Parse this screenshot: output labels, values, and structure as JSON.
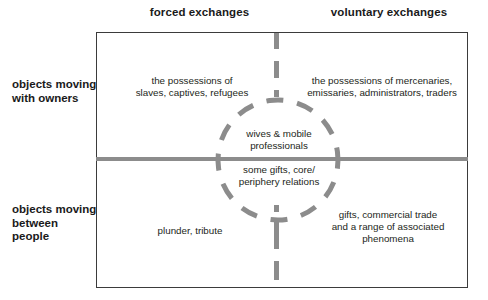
{
  "diagram": {
    "title_columns": {
      "left": "forced exchanges",
      "right": "voluntary exchanges"
    },
    "row_labels": {
      "top": [
        "objects moving",
        "with owners"
      ],
      "bottom": [
        "objects moving",
        "between",
        "people"
      ]
    },
    "cells": {
      "top_left": [
        "the possessions of",
        "slaves, captives, refugees"
      ],
      "top_right": [
        "the possessions of mercenaries,",
        "emissaries, administrators, traders"
      ],
      "circle_top": [
        "wives & mobile",
        "professionals"
      ],
      "circle_bottom": [
        "some gifts, core/",
        "periphery relations"
      ],
      "bottom_left": [
        "plunder, tribute"
      ],
      "bottom_right": [
        "gifts, commercial trade",
        "and a range of associated",
        "phenomena"
      ]
    },
    "colors": {
      "line_gray": "#8c8c8c",
      "border_dark": "#3b3b3b",
      "text_dark": "#1a1a1a",
      "text_body": "#231f20",
      "background": "#ffffff"
    }
  }
}
